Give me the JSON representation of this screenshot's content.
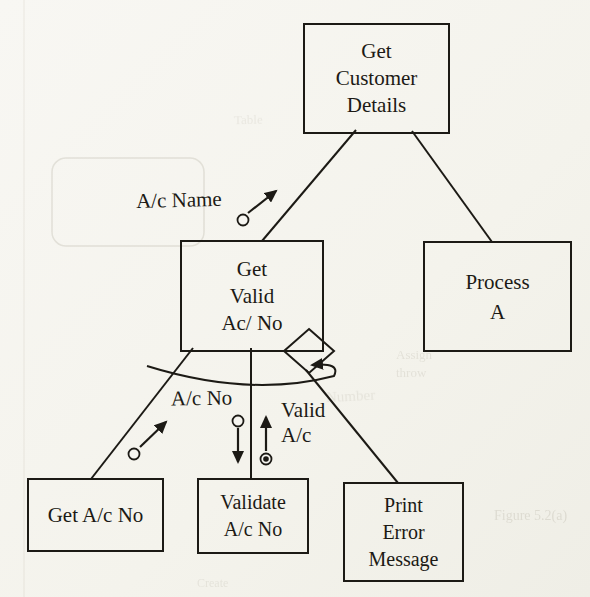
{
  "diagram": {
    "nodes": {
      "get_customer_details": "Get\nCustomer\nDetails",
      "get_valid_ac_no": "Get\nValid\nAc/ No",
      "process_a": "Process\nA",
      "get_ac_no": "Get A/c No",
      "validate_ac_no": "Validate\nA/c No",
      "print_error_message": "Print\nError\nMessage"
    },
    "couples": {
      "ac_name": "A/c Name",
      "ac_no": "A/c No",
      "valid_ac": "Valid\nA/c"
    },
    "symbols": [
      "decision-diamond-icon",
      "loop-arrow-icon",
      "data-couple-circle",
      "control-couple-circle"
    ]
  },
  "ghost": {
    "fragments": [
      "Table",
      "Assign",
      "throw",
      "Number",
      "Figure 5.2(a)",
      "Create"
    ]
  },
  "colors": {
    "ink": "#1c1a15",
    "paper": "#f6f5f0",
    "ghost": "#9a9484"
  }
}
